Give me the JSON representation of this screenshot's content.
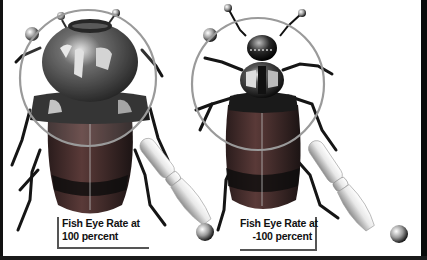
{
  "figure": {
    "panels": [
      {
        "id": "left",
        "caption_line1": "Fish Eye Rate at",
        "caption_line2": "100 percent",
        "fish_eye_rate_percent": 100
      },
      {
        "id": "right",
        "caption_line1": "Fish Eye Rate at",
        "caption_line2": "-100 percent",
        "fish_eye_rate_percent": -100
      }
    ]
  },
  "colors": {
    "background": "#ffffff",
    "border": "#111111",
    "beetle_body": "#1a1a1a",
    "beetle_highlight": "#d8d8d8",
    "wing_red": "#4a2a2a",
    "lens_ring": "#9a9a9a",
    "handle": "#e6e6e6"
  }
}
